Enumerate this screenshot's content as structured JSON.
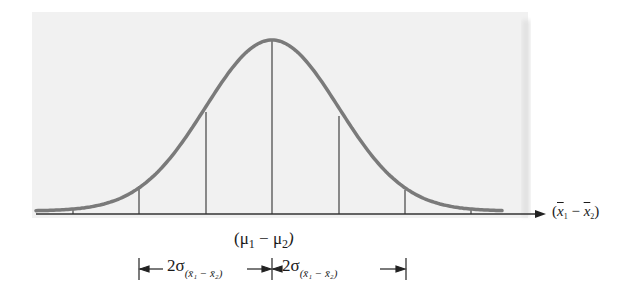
{
  "diagram": {
    "title": "",
    "type": "normal-distribution-sampling",
    "center_label": "(μ₁ − μ₂)",
    "center_label_parts": {
      "open": "(",
      "mu1": "μ",
      "sub1": "1",
      "minus": " − ",
      "mu2": "μ",
      "sub2": "2",
      "close": ")"
    },
    "axis_label": "(x̄₁ − x̄₂)",
    "axis_label_parts": {
      "open": "(",
      "x1": "x",
      "s1": "1",
      "minus": " − ",
      "x2": "x",
      "s2": "2",
      "close": ")"
    },
    "interval_left": {
      "prefix": "2σ",
      "subscript": "(x̄₁ − x̄₂)"
    },
    "interval_right": {
      "prefix": "2σ",
      "subscript": "(x̄₁ − x̄₂)"
    },
    "vertical_lines_sigma": [
      -3,
      -2,
      -1,
      0,
      1,
      2,
      3
    ],
    "colors": {
      "background_panel": "#f1f1f1",
      "curve": "#7a7a7a",
      "lines": "#444444",
      "text": "#1a1a1a"
    }
  }
}
